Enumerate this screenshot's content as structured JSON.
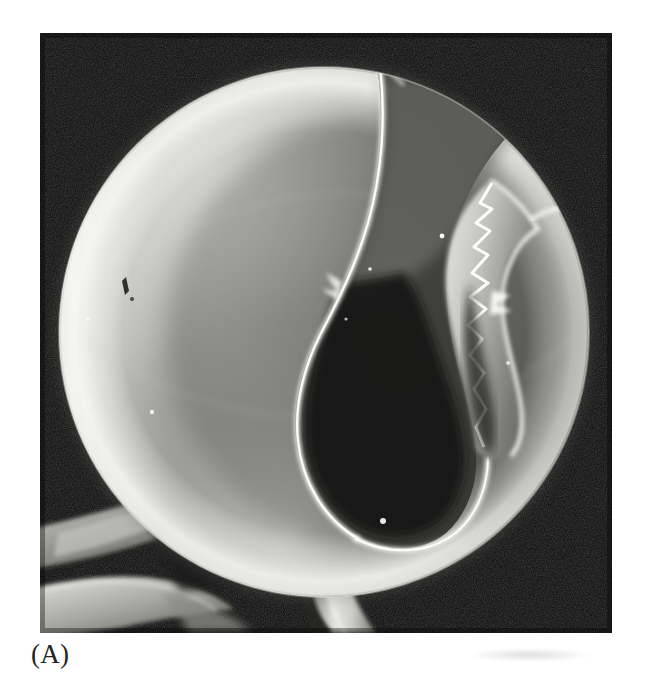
{
  "figure": {
    "caption_label": "(A)",
    "panel_id": "A",
    "kind": "scanning-electron-micrograph",
    "canvas": {
      "width": 649,
      "height": 695,
      "background": "#ffffff"
    },
    "photo": {
      "x": 40,
      "y": 33,
      "width": 572,
      "height": 600,
      "background_color": "#070707",
      "tone": "grayscale",
      "print_style": "halftone"
    }
  },
  "scene": {
    "background_label": "dark-field background",
    "background_color": "#0a0a0a",
    "sphere": {
      "label": "hollow microsphere",
      "center_x": 324,
      "center_y": 332,
      "radius": 265,
      "rim_highlight_color": "#ededea",
      "body_mid_color": "#9a9a96",
      "body_shadow_color": "#4e4e4c",
      "surface_texture": "granular"
    },
    "fracture": {
      "label": "shell fracture opening",
      "cavity_color": "#151513",
      "edge_highlight_color": "#f2f2ee",
      "description": "broken shell exposing dark interior cavity"
    },
    "substrate_filaments": {
      "label": "folded membrane ribbons",
      "color": "#b9b9b4",
      "position": "lower-left"
    },
    "stalk": {
      "label": "support fiber beneath sphere",
      "color": "#d3d3ce"
    },
    "surface_marks": [
      {
        "name": "dark-pit-mark",
        "x": 123,
        "y": 290
      },
      {
        "name": "bright-speck-upper",
        "x": 442,
        "y": 236
      },
      {
        "name": "bright-speck-lower",
        "x": 383,
        "y": 521
      },
      {
        "name": "bright-speck-left",
        "x": 152,
        "y": 412
      }
    ]
  },
  "colors": {
    "page_background": "#ffffff",
    "photo_black": "#070707",
    "caption_text": "#232323",
    "highlight_white": "#f4f4f0",
    "mid_gray": "#8e8e8a",
    "deep_shadow": "#3a3a38"
  }
}
